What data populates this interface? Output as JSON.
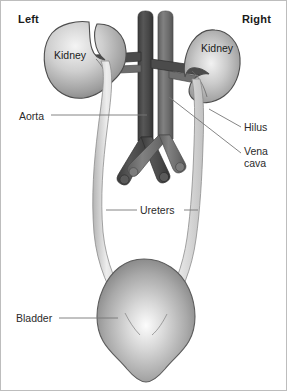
{
  "figure": {
    "width": 287,
    "height": 391,
    "background": "#ffffff",
    "border_color": "#bdbdbd"
  },
  "orientation": {
    "left_label": "Left",
    "right_label": "Right"
  },
  "organs": {
    "kidney_left_label": "Kidney",
    "kidney_right_label": "Kidney"
  },
  "callouts": [
    {
      "name": "aorta",
      "label": "Aorta"
    },
    {
      "name": "hilus",
      "label": "Hilus"
    },
    {
      "name": "vena-cava",
      "label_line1": "Vena",
      "label_line2": "cava"
    },
    {
      "name": "ureters",
      "label": "Ureters"
    },
    {
      "name": "bladder",
      "label": "Bladder"
    }
  ],
  "callout_text": {
    "aorta": "Aorta",
    "hilus": "Hilus",
    "vena_cava_line1": "Vena",
    "vena_cava_line2": "cava",
    "ureters": "Ureters",
    "bladder": "Bladder"
  },
  "colors": {
    "aorta_dark": "#4a4a4a",
    "aorta_shade": "#3a3a3a",
    "vena_cava_gray": "#6e6e6e",
    "vena_cava_shade": "#5a5a5a",
    "kidney_light": "#f2f2f2",
    "kidney_mid": "#b0b0b0",
    "kidney_dark": "#707070",
    "kidney_outline": "#4d4d4d",
    "ureter_fill": "#dcdcdc",
    "ureter_outline": "#8a8a8a",
    "bladder_light": "#fbfbfb",
    "bladder_mid": "#aaaaaa",
    "bladder_dark": "#6f6f6f",
    "bladder_outline": "#5c5c5c",
    "leader_line": "#777777",
    "text": "#1a1a1a"
  }
}
